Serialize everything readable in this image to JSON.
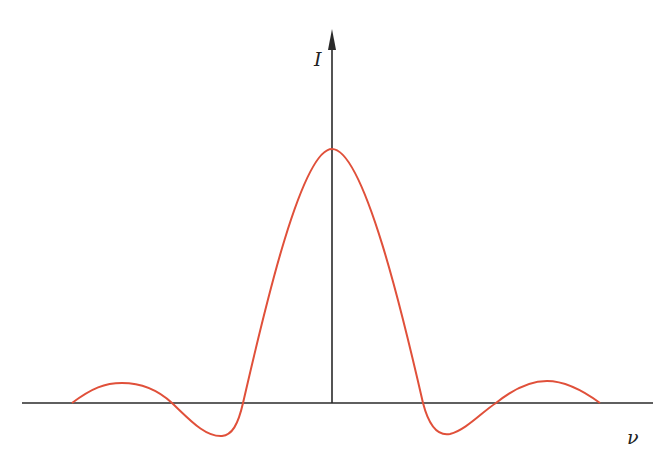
{
  "figure": {
    "y_axis_label": "I",
    "x_axis_label": "ν",
    "colors": {
      "curve": "#e0503a",
      "axis": "#2a2a2a"
    },
    "curve_path": "M72,403 C92,388 105,383 122,383 C142,383 158,390 172,403 C190,420 205,437 222,436 C232,435 238,425 243,403 C260,330 300,149 332,149 C364,149 404,320 423,403 C430,430 440,436 450,434 C466,430 482,412 496,403 C512,390 530,381 547,381 C566,381 585,392 600,403"
  }
}
